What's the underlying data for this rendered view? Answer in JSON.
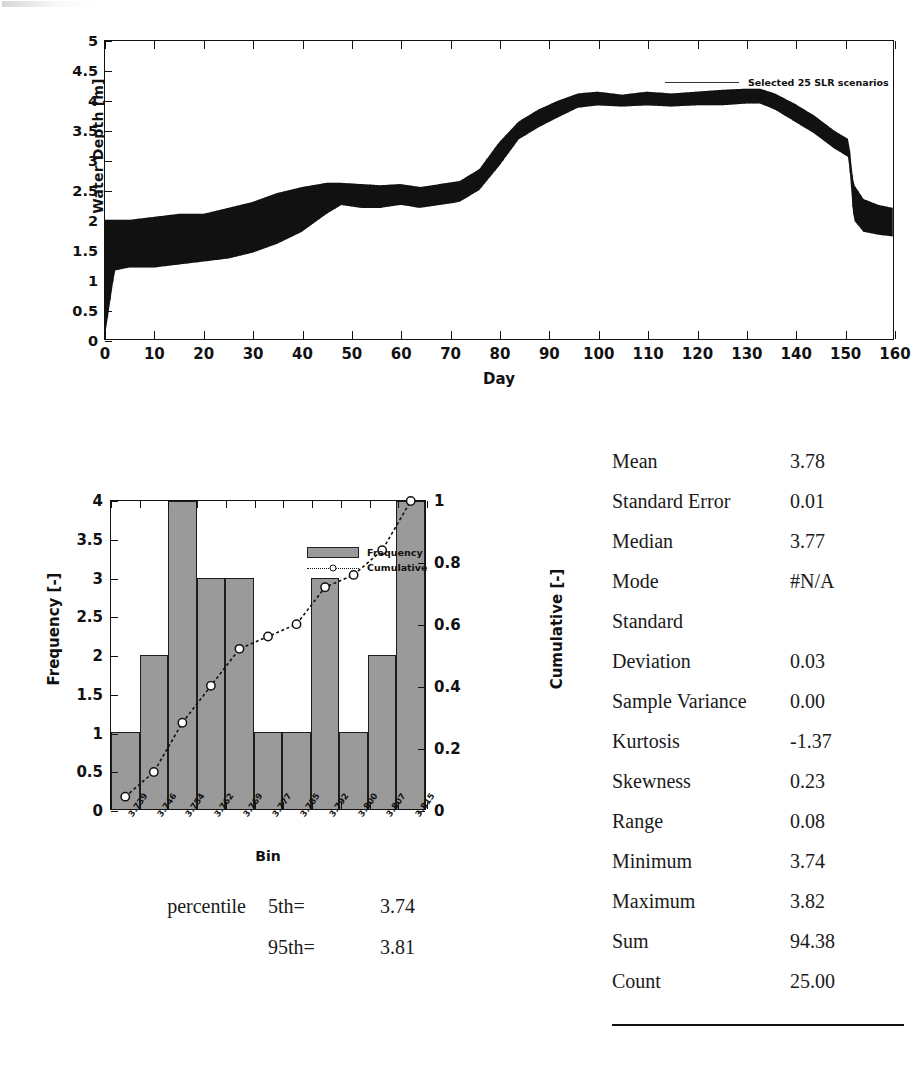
{
  "timeseries": {
    "ylabel": "Water Depth [m]",
    "xlabel": "Day",
    "legend_label": "Selected 25 SLR scenarios",
    "yticks": [
      "0",
      "0.5",
      "1",
      "1.5",
      "2",
      "2.5",
      "3",
      "3.5",
      "4",
      "4.5",
      "5"
    ],
    "xticks": [
      "0",
      "10",
      "20",
      "30",
      "40",
      "50",
      "60",
      "70",
      "80",
      "90",
      "100",
      "110",
      "120",
      "130",
      "140",
      "150",
      "160"
    ]
  },
  "histogram": {
    "ylabel_left": "Frequency [-]",
    "ylabel_right": "Cumulative [-]",
    "xlabel": "Bin",
    "legend": {
      "frequency_label": "Frequency",
      "cumulative_label": "Cumulative"
    },
    "yticks_left": [
      "0",
      "0.5",
      "1",
      "1.5",
      "2",
      "2.5",
      "3",
      "3.5",
      "4"
    ],
    "yticks_right": [
      "0",
      "0.2",
      "0.4",
      "0.6",
      "0.8",
      "1"
    ]
  },
  "percentile": {
    "word": "percentile",
    "rows": [
      {
        "key": "5th=",
        "value": "3.74"
      },
      {
        "key": "95th=",
        "value": "3.81"
      }
    ]
  },
  "stats": {
    "rows": [
      {
        "label": "Mean",
        "value": "3.78"
      },
      {
        "label": "Standard Error",
        "value": "0.01"
      },
      {
        "label": "Median",
        "value": "3.77"
      },
      {
        "label": "Mode",
        "value": "#N/A"
      },
      {
        "label": "Standard",
        "value": ""
      },
      {
        "label": "Deviation",
        "value": "0.03"
      },
      {
        "label": "Sample Variance",
        "value": "0.00"
      },
      {
        "label": "Kurtosis",
        "value": "-1.37"
      },
      {
        "label": "Skewness",
        "value": "0.23"
      },
      {
        "label": "Range",
        "value": "0.08"
      },
      {
        "label": "Minimum",
        "value": "3.74"
      },
      {
        "label": "Maximum",
        "value": "3.82"
      },
      {
        "label": "Sum",
        "value": "94.38"
      },
      {
        "label": "Count",
        "value": "25.00"
      }
    ]
  },
  "colors": {
    "bar_fill": "#9a9a9a",
    "line": "#111111",
    "axis": "#111111"
  },
  "chart_data": [
    {
      "type": "line",
      "title": "",
      "xlabel": "Day",
      "ylabel": "Water Depth [m]",
      "xlim": [
        0,
        160
      ],
      "ylim": [
        0,
        5
      ],
      "grid": false,
      "legend_position": "top-right",
      "series": [
        {
          "name": "Selected 25 SLR scenarios",
          "description": "Tidally oscillating water depth envelope; 25 overlaid sea-level-rise scenario traces",
          "x": [
            0,
            2,
            5,
            10,
            15,
            20,
            25,
            30,
            35,
            40,
            45,
            48,
            52,
            56,
            60,
            64,
            68,
            72,
            76,
            80,
            84,
            88,
            92,
            96,
            100,
            105,
            110,
            115,
            120,
            125,
            130,
            133,
            136,
            140,
            144,
            148,
            151,
            152,
            154,
            157,
            160
          ],
          "y_mean": [
            1.0,
            1.55,
            1.6,
            1.65,
            1.7,
            1.75,
            1.8,
            1.9,
            2.05,
            2.2,
            2.4,
            2.5,
            2.45,
            2.42,
            2.45,
            2.4,
            2.45,
            2.5,
            2.7,
            3.1,
            3.5,
            3.7,
            3.85,
            4.0,
            4.05,
            4.0,
            4.05,
            4.0,
            4.05,
            4.05,
            4.1,
            4.1,
            4.0,
            3.8,
            3.6,
            3.35,
            3.2,
            2.35,
            2.1,
            2.0,
            1.95
          ],
          "y_min": [
            0.05,
            1.15,
            1.2,
            1.2,
            1.25,
            1.3,
            1.35,
            1.45,
            1.6,
            1.8,
            2.1,
            2.25,
            2.2,
            2.2,
            2.25,
            2.2,
            2.25,
            2.3,
            2.5,
            2.9,
            3.35,
            3.55,
            3.72,
            3.88,
            3.92,
            3.9,
            3.92,
            3.9,
            3.92,
            3.92,
            3.95,
            3.95,
            3.85,
            3.65,
            3.45,
            3.2,
            3.05,
            2.0,
            1.8,
            1.75,
            1.72
          ],
          "y_max": [
            2.0,
            2.0,
            2.0,
            2.05,
            2.1,
            2.1,
            2.2,
            2.3,
            2.45,
            2.55,
            2.62,
            2.62,
            2.6,
            2.58,
            2.6,
            2.55,
            2.6,
            2.65,
            2.85,
            3.3,
            3.65,
            3.85,
            4.0,
            4.12,
            4.15,
            4.1,
            4.15,
            4.12,
            4.15,
            4.18,
            4.2,
            4.2,
            4.12,
            3.95,
            3.75,
            3.5,
            3.35,
            2.6,
            2.35,
            2.25,
            2.2
          ]
        }
      ]
    },
    {
      "type": "bar",
      "title": "",
      "xlabel": "Bin",
      "ylabel": "Frequency [-]",
      "ylabel_secondary": "Cumulative [-]",
      "categories": [
        "3.739",
        "3.746",
        "3.754",
        "3.762",
        "3.769",
        "3.777",
        "3.785",
        "3.792",
        "3.800",
        "3.807",
        "3.815"
      ],
      "values": [
        1,
        2,
        4,
        3,
        3,
        1,
        1,
        3,
        1,
        2,
        4
      ],
      "ylim": [
        0,
        4
      ],
      "ylim_secondary": [
        0,
        1
      ],
      "grid": false,
      "legend_position": "inside-top-center",
      "series": [
        {
          "name": "Frequency",
          "type": "bar",
          "values": [
            1,
            2,
            4,
            3,
            3,
            1,
            1,
            3,
            1,
            2,
            4
          ]
        },
        {
          "name": "Cumulative",
          "type": "line",
          "axis": "secondary",
          "values": [
            0.04,
            0.12,
            0.28,
            0.4,
            0.52,
            0.56,
            0.6,
            0.72,
            0.76,
            0.84,
            1.0
          ]
        }
      ]
    }
  ]
}
